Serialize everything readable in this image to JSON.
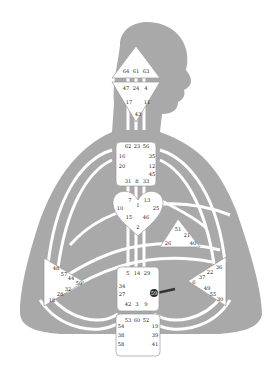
{
  "diagram": {
    "type": "human-design-bodygraph",
    "colors": {
      "silhouette": "#a9a9a9",
      "center_fill": "#ffffff",
      "center_stroke": "#9a9a9a",
      "channel": "#ffffff",
      "active_gate": "#2a2a2a",
      "active_channel": "#333333",
      "text": "#222222"
    },
    "centers": {
      "head": {
        "gates": [
          "64",
          "61",
          "63"
        ]
      },
      "ajna": {
        "gates": [
          "47",
          "24",
          "4",
          "17",
          "11",
          "43"
        ]
      },
      "throat": {
        "gates": [
          "62",
          "23",
          "56",
          "16",
          "35",
          "20",
          "12",
          "45",
          "31",
          "8",
          "33"
        ]
      },
      "g": {
        "gates": [
          "7",
          "1",
          "13",
          "10",
          "25",
          "15",
          "46",
          "2"
        ]
      },
      "heart": {
        "gates": [
          "51",
          "21",
          "26",
          "40"
        ]
      },
      "spleen": {
        "gates": [
          "48",
          "57",
          "44",
          "50",
          "32",
          "28",
          "18"
        ]
      },
      "sacral": {
        "gates": [
          "5",
          "14",
          "29",
          "34",
          "27",
          "59",
          "42",
          "3",
          "9"
        ]
      },
      "solar_plexus": {
        "gates": [
          "36",
          "22",
          "37",
          "6",
          "49",
          "55",
          "30"
        ]
      },
      "root": {
        "gates": [
          "53",
          "60",
          "52",
          "54",
          "19",
          "38",
          "39",
          "58",
          "41"
        ]
      }
    },
    "active_gate": "59"
  }
}
